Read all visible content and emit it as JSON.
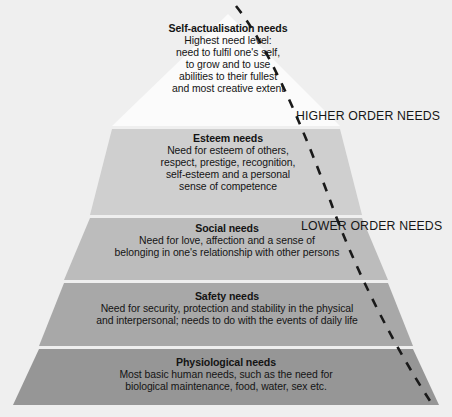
{
  "diagram": {
    "background_color": "#efefef"
  },
  "tiers": [
    {
      "id": "self-actualisation",
      "title": "Self-actualisation needs",
      "body": "Highest need level:\nneed to fulfil one's self,\nto grow and to use\nabilities to their fullest\nand most creative extent",
      "fill_color": "#ffffff"
    },
    {
      "id": "esteem",
      "title": "Esteem needs",
      "body": "Need for esteem of others,\nrespect, prestige, recognition,\nself-esteem and a personal\nsense of competence",
      "fill_color": "#cfcfcf"
    },
    {
      "id": "social",
      "title": "Social needs",
      "body": "Need for love, affection and a sense of\nbelonging in one's relationship with other persons",
      "fill_color": "#bcbcbc"
    },
    {
      "id": "safety",
      "title": "Safety needs",
      "body": "Need for security, protection and stability in the physical\nand interpersonal; needs to do with the events of daily life",
      "fill_color": "#a8a8a8"
    },
    {
      "id": "physiological",
      "title": "Physiological needs",
      "body": "Most basic human needs, such as the need for\nbiological maintenance, food, water, sex etc.",
      "fill_color": "#969696"
    }
  ],
  "order_labels": {
    "higher": "HIGHER ORDER NEEDS",
    "lower": "LOWER ORDER NEEDS"
  },
  "divider_curve": {
    "style": "dashed",
    "color": "#1a1a1a"
  }
}
